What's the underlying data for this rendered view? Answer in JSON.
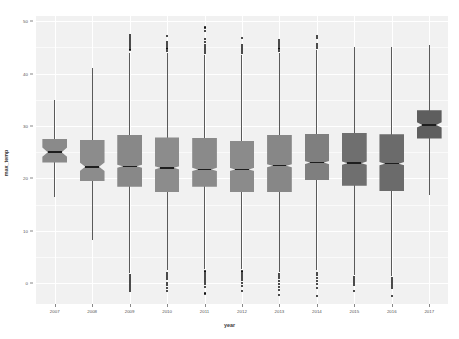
{
  "chart_data": {
    "type": "box",
    "title": "",
    "xlabel": "year",
    "ylabel": "max_temp",
    "grid": true,
    "legend": false,
    "xlim": [
      2006.5,
      2017.5
    ],
    "ylim": [
      -4,
      51
    ],
    "yticks": [
      0,
      10,
      20,
      30,
      40,
      50
    ],
    "ytick_labels": [
      "0",
      "10",
      "20",
      "30",
      "40",
      "50"
    ],
    "categories": [
      "2007",
      "2008",
      "2009",
      "2010",
      "2011",
      "2012",
      "2013",
      "2014",
      "2015",
      "2016",
      "2017"
    ],
    "boxes": [
      {
        "year": "2007",
        "lower_whisker": 16.5,
        "q1": 23.0,
        "median": 25.0,
        "q3": 27.5,
        "upper_whisker": 35.0,
        "notch_lower": 24.1,
        "notch_upper": 25.9,
        "fill": "#8a8a8a",
        "outliers_high": [],
        "outliers_low": []
      },
      {
        "year": "2008",
        "lower_whisker": 8.2,
        "q1": 19.5,
        "median": 22.2,
        "q3": 27.3,
        "upper_whisker": 41.0,
        "notch_lower": 21.4,
        "notch_upper": 23.0,
        "fill": "#8c8c8c",
        "outliers_high": [],
        "outliers_low": []
      },
      {
        "year": "2009",
        "lower_whisker": 2.0,
        "q1": 18.4,
        "median": 22.3,
        "q3": 28.3,
        "upper_whisker": 44.0,
        "notch_lower": 22.0,
        "notch_upper": 22.6,
        "fill": "#888888",
        "outliers_high": [
          44.6,
          45.0,
          45.4,
          45.8,
          46.2,
          46.6,
          47.0,
          47.3
        ],
        "outliers_low": [
          1.6,
          1.2,
          0.8,
          0.4,
          0.0,
          -0.4,
          -0.8,
          -1.2,
          -1.6
        ]
      },
      {
        "year": "2010",
        "lower_whisker": 2.4,
        "q1": 17.3,
        "median": 22.0,
        "q3": 27.8,
        "upper_whisker": 44.0,
        "notch_lower": 21.7,
        "notch_upper": 22.3,
        "fill": "#8c8c8c",
        "outliers_high": [
          44.4,
          44.8,
          45.2,
          45.6,
          46.0,
          47.2
        ],
        "outliers_low": [
          2.0,
          1.6,
          1.2,
          0.8,
          0.0,
          -0.4,
          -1.0,
          -1.6
        ]
      },
      {
        "year": "2011",
        "lower_whisker": 2.6,
        "q1": 18.4,
        "median": 21.7,
        "q3": 27.7,
        "upper_whisker": 43.5,
        "notch_lower": 21.4,
        "notch_upper": 22.0,
        "fill": "#8a8a8a",
        "outliers_high": [
          43.9,
          44.3,
          44.7,
          45.1,
          45.5,
          46.0,
          46.6,
          48.2,
          48.8
        ],
        "outliers_low": [
          2.2,
          1.8,
          1.4,
          1.0,
          0.6,
          0.2,
          -0.2,
          -0.8,
          -2.0
        ]
      },
      {
        "year": "2012",
        "lower_whisker": 2.6,
        "q1": 17.4,
        "median": 21.7,
        "q3": 27.2,
        "upper_whisker": 43.5,
        "notch_lower": 21.4,
        "notch_upper": 22.0,
        "fill": "#8b8b8b",
        "outliers_high": [
          43.9,
          44.3,
          44.7,
          45.1,
          45.5,
          46.8
        ],
        "outliers_low": [
          2.2,
          1.8,
          1.4,
          1.0,
          0.6,
          0.0,
          -0.6,
          -1.6
        ]
      },
      {
        "year": "2013",
        "lower_whisker": 2.2,
        "q1": 17.4,
        "median": 22.4,
        "q3": 28.3,
        "upper_whisker": 44.0,
        "notch_lower": 22.1,
        "notch_upper": 22.7,
        "fill": "#878787",
        "outliers_high": [
          44.4,
          44.8,
          45.2,
          45.6,
          46.0,
          46.4
        ],
        "outliers_low": [
          1.8,
          1.4,
          1.0,
          0.4,
          -0.2,
          -0.8,
          -1.4,
          -2.2
        ]
      },
      {
        "year": "2014",
        "lower_whisker": 2.4,
        "q1": 19.6,
        "median": 23.0,
        "q3": 28.5,
        "upper_whisker": 44.5,
        "notch_lower": 22.7,
        "notch_upper": 23.3,
        "fill": "#7f7f7f",
        "outliers_high": [
          44.9,
          45.3,
          45.7,
          46.8,
          47.2
        ],
        "outliers_low": [
          2.0,
          1.6,
          1.0,
          0.4,
          -0.2,
          -1.0,
          -2.4
        ]
      },
      {
        "year": "2015",
        "lower_whisker": 1.6,
        "q1": 18.6,
        "median": 22.9,
        "q3": 28.7,
        "upper_whisker": 45.0,
        "notch_lower": 22.6,
        "notch_upper": 23.2,
        "fill": "#6f6f6f",
        "outliers_high": [],
        "outliers_low": [
          1.2,
          0.8,
          0.4,
          0.0,
          -0.4,
          -1.6
        ]
      },
      {
        "year": "2016",
        "lower_whisker": 1.4,
        "q1": 17.5,
        "median": 22.8,
        "q3": 28.4,
        "upper_whisker": 45.0,
        "notch_lower": 22.5,
        "notch_upper": 23.1,
        "fill": "#6b6b6b",
        "outliers_high": [],
        "outliers_low": [
          1.0,
          0.6,
          0.2,
          -0.2,
          -0.6,
          -1.0,
          -2.4
        ]
      },
      {
        "year": "2017",
        "lower_whisker": 16.8,
        "q1": 27.6,
        "median": 30.2,
        "q3": 33.0,
        "upper_whisker": 45.5,
        "notch_lower": 29.7,
        "notch_upper": 30.7,
        "fill": "#5e5e5e",
        "outliers_high": [],
        "outliers_low": []
      }
    ]
  }
}
